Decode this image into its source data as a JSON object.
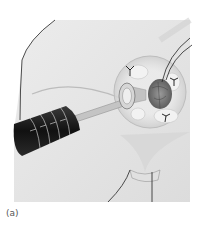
{
  "figure": {
    "caption": "(a)",
    "colors": {
      "background": "#ffffff",
      "skin": "#e6e6e6",
      "skin_shadow": "#d2d2d2",
      "outline": "#222222",
      "instrument_body": "#1a1a1a",
      "instrument_rod": "#b8b8b8",
      "ring": "#c8c8c8",
      "tissue": "#7a7a7a"
    },
    "instrument": {
      "scale_marks": [
        "1",
        "2",
        "3",
        "4"
      ]
    }
  }
}
